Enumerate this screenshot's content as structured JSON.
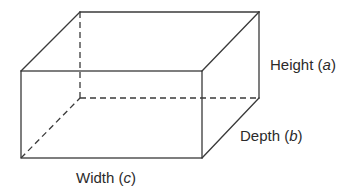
{
  "diagram": {
    "type": "rectangular-prism",
    "labels": {
      "height": {
        "word": "Height",
        "var": "a"
      },
      "depth": {
        "word": "Depth",
        "var": "b"
      },
      "width": {
        "word": "Width",
        "var": "c"
      }
    },
    "colors": {
      "line": "#3a3a3a",
      "text": "#2b2b2b",
      "background": "#ffffff"
    }
  }
}
